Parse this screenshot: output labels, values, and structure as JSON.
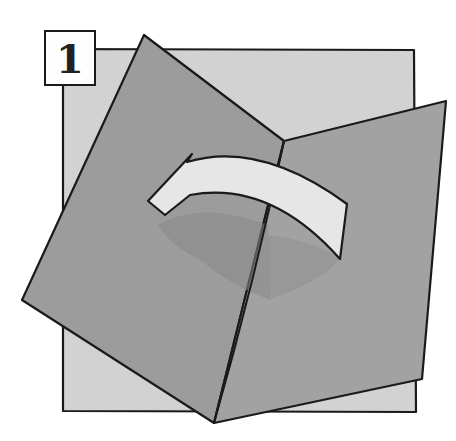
{
  "step": {
    "number": "1"
  },
  "illustration": {
    "description": "Square sheet folded along a diagonal crease with a curved arrow indicating the fold direction",
    "colors": {
      "background_sheet": "#d2d2d2",
      "folded_panel": "#9c9c9c",
      "shadow": "#888888",
      "arrow_fill": "#e6e6e6",
      "outline": "#1a1a1a"
    }
  }
}
